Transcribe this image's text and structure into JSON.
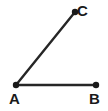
{
  "figure": {
    "kind": "geometry-angle-diagram",
    "background_color": "#ffffff",
    "stroke_color": "#262626",
    "label_color": "#1a1a1a",
    "vertex_dot_color": "#1a1a1a",
    "stroke_width": 2.4,
    "vertex_dot_radius": 3.2
  },
  "points": {
    "A": {
      "label": "A",
      "x": 16,
      "y": 85,
      "label_x": 9,
      "label_y": 91
    },
    "B": {
      "label": "B",
      "x": 96,
      "y": 85,
      "label_x": 89,
      "label_y": 91
    },
    "C": {
      "label": "C",
      "x": 75,
      "y": 12,
      "label_x": 77,
      "label_y": 3
    }
  },
  "segments": [
    {
      "name": "AB",
      "from": "A",
      "to": "B"
    },
    {
      "name": "AC",
      "from": "A",
      "to": "C"
    }
  ],
  "chart_data": {
    "type": "scatter",
    "title": "",
    "xlabel": "",
    "ylabel": "",
    "xlim": [
      0,
      108
    ],
    "ylim": [
      0,
      111
    ],
    "grid": false,
    "legend": "none",
    "annotations": [
      "A",
      "B",
      "C"
    ],
    "series": [
      {
        "name": "vertices",
        "x": [
          16,
          96,
          75
        ],
        "y": [
          85,
          85,
          12
        ],
        "labels": [
          "A",
          "B",
          "C"
        ]
      },
      {
        "name": "ray-AB",
        "x": [
          16,
          96
        ],
        "y": [
          85,
          85
        ]
      },
      {
        "name": "ray-AC",
        "x": [
          16,
          75
        ],
        "y": [
          85,
          12
        ]
      }
    ]
  }
}
